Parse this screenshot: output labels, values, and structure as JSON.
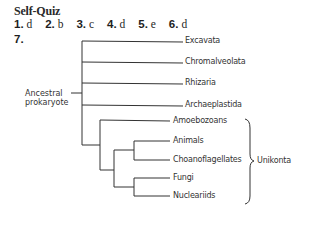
{
  "title": "Self-Quiz",
  "answers": [
    {
      "num": "1.",
      "val": "d"
    },
    {
      "num": "2.",
      "val": "b"
    },
    {
      "num": "3.",
      "val": "c"
    },
    {
      "num": "4.",
      "val": "d"
    },
    {
      "num": "5.",
      "val": "e"
    },
    {
      "num": "6.",
      "val": "d"
    }
  ],
  "question7": "7.",
  "tree": {
    "root_line1": "Ancestral",
    "root_line2": "prokaryote",
    "taxa": [
      "Excavata",
      "Chromalveolata",
      "Rhizaria",
      "Archaeplastida",
      "Amoebozoans",
      "Animals",
      "Choanoflagellates",
      "Fungi",
      "Nucleariids"
    ],
    "group_label": "Unikonta",
    "line_color": "#333333"
  }
}
